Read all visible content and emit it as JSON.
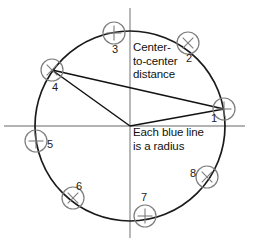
{
  "figure": {
    "canvas": {
      "width": 257,
      "height": 244,
      "background": "#ffffff"
    }
  },
  "annotations": {
    "center_distance": {
      "name": "center-to-center-distance",
      "line1": "Center-",
      "line2": "to-center",
      "line3": "distance"
    },
    "blue_radius": {
      "name": "each-blue-line-is-a-radius",
      "line1": "Each blue line",
      "line2": "is a radius"
    }
  },
  "chart_data": {
    "type": "scatter",
    "xlabel": "",
    "ylabel": "",
    "grid": false,
    "legend": null,
    "geometry": {
      "center": {
        "x": 130,
        "y": 126
      },
      "radius": 95,
      "axes": {
        "horizontal": {
          "x1": 4,
          "y1": 126,
          "x2": 245,
          "y2": 126
        },
        "vertical": {
          "x1": 130,
          "y1": 8,
          "x2": 130,
          "y2": 238
        }
      }
    },
    "categories": [
      "1",
      "2",
      "3",
      "4",
      "5",
      "6",
      "7",
      "8"
    ],
    "points": [
      {
        "label": "1",
        "x": 224,
        "y": 109,
        "angle_deg": 10,
        "label_x": 211,
        "label_y": 122,
        "marker": "circle-with-x"
      },
      {
        "label": "2",
        "x": 188,
        "y": 43,
        "angle_deg": 51,
        "label_x": 186,
        "label_y": 62,
        "marker": "circle-with-x"
      },
      {
        "label": "3",
        "x": 114,
        "y": 33,
        "angle_deg": 100,
        "label_x": 112,
        "label_y": 53,
        "marker": "circle-with-x"
      },
      {
        "label": "4",
        "x": 52,
        "y": 70,
        "angle_deg": 144,
        "label_x": 52,
        "label_y": 91,
        "marker": "circle-with-x"
      },
      {
        "label": "5",
        "x": 36,
        "y": 141,
        "angle_deg": 189,
        "label_x": 47,
        "label_y": 148,
        "marker": "circle-with-x"
      },
      {
        "label": "6",
        "x": 73,
        "y": 198,
        "angle_deg": 229,
        "label_x": 76,
        "label_y": 190,
        "marker": "circle-with-x"
      },
      {
        "label": "7",
        "x": 145,
        "y": 216,
        "angle_deg": 279,
        "label_x": 141,
        "label_y": 201,
        "marker": "circle-with-x"
      },
      {
        "label": "8",
        "x": 207,
        "y": 177,
        "angle_deg": 329,
        "label_x": 190,
        "label_y": 177,
        "marker": "circle-with-x"
      }
    ],
    "segments": [
      {
        "name": "radius-to-point-4",
        "from": "center",
        "to": "4",
        "x1": 130,
        "y1": 126,
        "x2": 52,
        "y2": 70,
        "role": "radius"
      },
      {
        "name": "radius-to-point-1",
        "from": "center",
        "to": "1",
        "x1": 130,
        "y1": 126,
        "x2": 224,
        "y2": 109,
        "role": "radius"
      },
      {
        "name": "chord-point-4-to-point-1",
        "from": "4",
        "to": "1",
        "x1": 52,
        "y1": 70,
        "x2": 224,
        "y2": 109,
        "role": "center-to-center-distance"
      }
    ],
    "marker_radius": 11,
    "colors": {
      "circle_outline": "#1a1a1a",
      "axis": "#9a9a9a",
      "marker_outline": "#7d7d7d",
      "radius_line": "#111111",
      "text": "#111111"
    }
  }
}
